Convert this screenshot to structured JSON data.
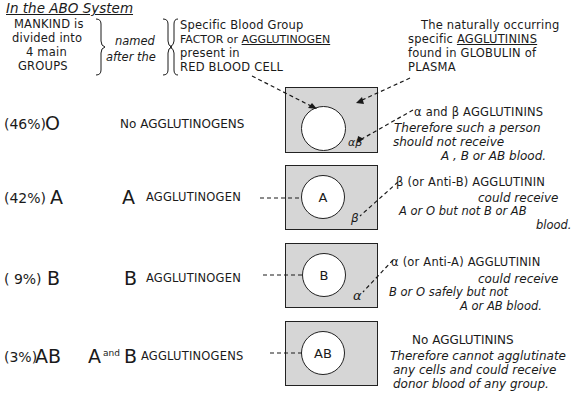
{
  "header": {
    "title": "In the ABO System",
    "left_block": [
      "MANKIND is",
      "divided into",
      "4 main",
      "GROUPS"
    ],
    "connector": [
      "named",
      "after the"
    ],
    "middle_block": {
      "line1": "Specific Blood Group",
      "line2_prefix": "FACTOR or ",
      "line2_underlined": "AGGLUTINOGEN",
      "line3": "present in",
      "line4": "RED BLOOD CELL"
    },
    "right_block": {
      "line1": "The naturally occurring",
      "line2_prefix": "specific ",
      "line2_underlined": "AGGLUTININS",
      "line3": "found  in  GLOBULIN of",
      "line4": "PLASMA"
    }
  },
  "groups": [
    {
      "percent": "(46%)",
      "name": "O",
      "agglutinogen_prefix": "",
      "agglutinogen_label": "No AGGLUTINOGENS",
      "cell_label": "",
      "plasma_label": "αβ",
      "agglutinin_title": "α and β AGGLUTININS",
      "notes": [
        "Therefore such a person",
        "should  not receive",
        "A , B or AB blood."
      ]
    },
    {
      "percent": "(42%)",
      "name": "A",
      "agglutinogen_prefix": "A",
      "agglutinogen_label": "AGGLUTINOGEN",
      "cell_label": "A",
      "plasma_label": "β",
      "agglutinin_title": "β (or Anti-B) AGGLUTININ",
      "notes": [
        "could receive",
        "A or O  but  not  B or AB",
        "blood."
      ]
    },
    {
      "percent": "( 9%)",
      "name": "B",
      "agglutinogen_prefix": "B",
      "agglutinogen_label": "AGGLUTINOGEN",
      "cell_label": "B",
      "plasma_label": "α",
      "agglutinin_title": "α (or Anti-A)  AGGLUTININ",
      "notes": [
        "could receive",
        "B or O  safely but  not",
        "A or AB  blood."
      ]
    },
    {
      "percent": "(3%)",
      "name": "AB",
      "agglutinogen_prefix": "A",
      "agglutinogen_and": "and",
      "agglutinogen_prefix2": "B",
      "agglutinogen_label": "AGGLUTINOGENS",
      "cell_label": "AB",
      "plasma_label": "",
      "agglutinin_title": "No AGGLUTININS",
      "notes": [
        "Therefore cannot agglutinate",
        "any cells and could receive",
        "donor blood of any group."
      ]
    }
  ],
  "colors": {
    "ink": "#1a1a1a",
    "plasma_fill": "#d6d6d6",
    "cell_fill": "#ffffff"
  }
}
